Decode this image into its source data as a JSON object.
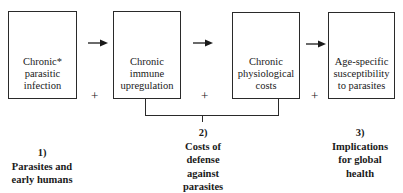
{
  "diagram": {
    "type": "flow",
    "boxes": [
      {
        "id": "chronic-parasitic-infection",
        "lines": [
          "Chronic*",
          "parasitic",
          "infection"
        ]
      },
      {
        "id": "chronic-immune-upregulation",
        "lines": [
          "Chronic",
          "immune",
          "upregulation"
        ]
      },
      {
        "id": "chronic-physiological-costs",
        "lines": [
          "Chronic",
          "physiological",
          "costs"
        ]
      },
      {
        "id": "age-specific-susceptibility",
        "lines": [
          "Age-specific",
          "susceptibility",
          "to parasites"
        ]
      }
    ],
    "connectors": {
      "arrow_symbol": "→",
      "plus_symbol": "+"
    },
    "sections": [
      {
        "number": "1)",
        "lines": [
          "Parasites and",
          "early humans"
        ]
      },
      {
        "number": "2)",
        "lines": [
          "Costs of",
          "defense",
          "against",
          "parasites"
        ]
      },
      {
        "number": "3)",
        "lines": [
          "Implications",
          "for global",
          "health"
        ]
      }
    ],
    "colors": {
      "stroke": "#2a2a2a",
      "text": "#1a1a1a",
      "background": "#ffffff"
    }
  }
}
